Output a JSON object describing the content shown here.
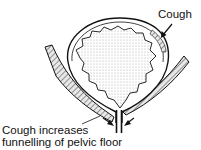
{
  "diagram": {
    "labels": {
      "cough": "Cough",
      "funnelling_line1": "Cough increases",
      "funnelling_line2": "funnelling of pelvic floor"
    },
    "colors": {
      "ink": "#111111",
      "stipple": "#bdbdbd",
      "background": "#ffffff"
    }
  }
}
